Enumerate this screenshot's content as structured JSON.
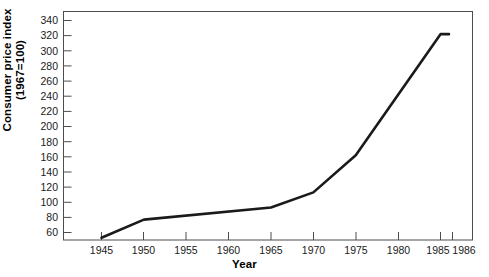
{
  "chart_data": {
    "type": "line",
    "title": "",
    "xlabel": "Year",
    "ylabel": "Consumer price index (1967=100)",
    "ylabel_line1": "Consumer price index",
    "ylabel_line2": "(1967=100)",
    "x": [
      1945,
      1950,
      1965,
      1970,
      1975,
      1985,
      1986
    ],
    "values": [
      53,
      77,
      93,
      113,
      162,
      322,
      322
    ],
    "series": [
      {
        "name": "Consumer price index",
        "points": [
          {
            "x": 1945,
            "y": 53
          },
          {
            "x": 1950,
            "y": 77
          },
          {
            "x": 1965,
            "y": 93
          },
          {
            "x": 1970,
            "y": 113
          },
          {
            "x": 1975,
            "y": 162
          },
          {
            "x": 1985,
            "y": 322
          },
          {
            "x": 1986,
            "y": 322
          }
        ]
      }
    ],
    "xlim": [
      1943,
      1988
    ],
    "ylim": [
      40,
      348
    ],
    "xticks": [
      1945,
      1950,
      1955,
      1960,
      1965,
      1970,
      1975,
      1980,
      1985,
      1986
    ],
    "xticklabels": [
      "1945",
      "1950",
      "1955",
      "1960",
      "1965",
      "1970",
      "1975",
      "1980",
      "1985",
      "1986"
    ],
    "yticks": [
      60,
      80,
      100,
      120,
      140,
      160,
      180,
      200,
      220,
      240,
      260,
      280,
      300,
      320,
      340
    ],
    "yticklabels": [
      "60",
      "80",
      "100",
      "120",
      "140",
      "160",
      "180",
      "200",
      "220",
      "240",
      "260",
      "280",
      "300",
      "320",
      "340"
    ],
    "grid": false,
    "legend": false,
    "line_color": "#1a1a1a",
    "frame_color": "#4d4d4d",
    "background": "#ffffff"
  }
}
